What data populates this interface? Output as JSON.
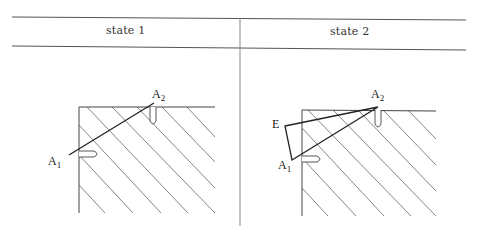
{
  "table": {
    "columns": [
      {
        "label": "state 1"
      },
      {
        "label": "state 2"
      }
    ]
  },
  "state1": {
    "labels": {
      "a1": "A",
      "a1_sub": "1",
      "a2": "A",
      "a2_sub": "2"
    },
    "points": {
      "A1": [
        69,
        155
      ],
      "A2": [
        154,
        103
      ]
    }
  },
  "state2": {
    "labels": {
      "e": "E",
      "a1": "A",
      "a1_sub": "1",
      "a2": "A",
      "a2_sub": "2"
    },
    "points": {
      "E": [
        285,
        126
      ],
      "A1": [
        292,
        160
      ],
      "A2": [
        378,
        107
      ]
    }
  },
  "colors": {
    "rule": "#555555",
    "hatch": "#666666",
    "stroke": "#222222"
  }
}
